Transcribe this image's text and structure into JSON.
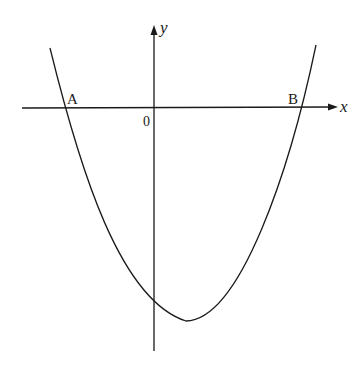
{
  "diagram": {
    "type": "parabola-graph",
    "axes": {
      "x_label": "x",
      "y_label": "y",
      "origin_label": "0"
    },
    "points": [
      {
        "label": "A",
        "description": "left x-intercept"
      },
      {
        "label": "B",
        "description": "right x-intercept"
      }
    ],
    "curve": {
      "kind": "upward-opening parabola",
      "vertex_position": "below x-axis, right of y-axis",
      "y_intercept": "negative"
    },
    "colors": {
      "stroke": "#1a1a1a",
      "background": "#ffffff"
    }
  }
}
